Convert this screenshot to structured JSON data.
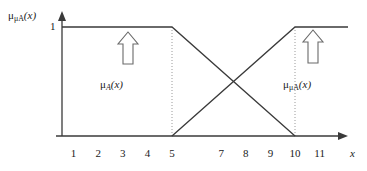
{
  "figure": {
    "background_color": "#ffffff",
    "line_color": "#3a3a3a",
    "text_color": "#1a1a1a",
    "guide_color": "#9a9a9a",
    "y_axis_label_parts": {
      "base": "μ",
      "subscript": "μA",
      "arg": "(x)"
    },
    "y_tick_one": "1",
    "x_axis_label": "x",
    "left_function_label_parts": {
      "base": "μ",
      "subscript": "A",
      "arg": "(x)"
    },
    "right_function_label_parts": {
      "base": "μ",
      "subscript": "μA",
      "arg": "(x)"
    },
    "left_arrow_icon": "up-arrow-outline",
    "right_arrow_icon": "up-arrow-outline",
    "y_axis_arrow_icon": "filled-arrowhead-up",
    "x_axis_arrow_icon": "filled-arrowhead-right"
  },
  "chart_data": {
    "type": "line",
    "title": "",
    "xlabel": "x",
    "ylabel": "μμA(x)",
    "xlim": [
      0,
      12
    ],
    "ylim": [
      0,
      1
    ],
    "grid": false,
    "legend": "none",
    "xticks": [
      {
        "value": 1,
        "label": "1"
      },
      {
        "value": 2,
        "label": "2"
      },
      {
        "value": 3,
        "label": "3"
      },
      {
        "value": 4,
        "label": "4"
      },
      {
        "value": 5,
        "label": "5"
      },
      {
        "value": 6,
        "label": ""
      },
      {
        "value": 7,
        "label": "7"
      },
      {
        "value": 8,
        "label": "8"
      },
      {
        "value": 9,
        "label": "9"
      },
      {
        "value": 10,
        "label": "10"
      },
      {
        "value": 11,
        "label": "11"
      }
    ],
    "yticks": [
      {
        "value": 1,
        "label": "1"
      }
    ],
    "series": [
      {
        "name": "μA(x)",
        "description": "plateau at 1 until x=5 then falls linearly to 0 at x=10",
        "x": [
          0,
          5,
          10
        ],
        "y": [
          1,
          1,
          0
        ]
      },
      {
        "name": "μμA(x)",
        "description": "zero until x=5 then rises linearly to 1 at x=10 and stays at 1",
        "x": [
          5,
          10,
          12
        ],
        "y": [
          0,
          1,
          1
        ]
      }
    ],
    "guides": [
      {
        "type": "vertical-dotted",
        "x": 5,
        "y_from": 0,
        "y_to": 1
      },
      {
        "type": "vertical-dotted",
        "x": 10,
        "y_from": 0,
        "y_to": 1
      }
    ],
    "annotations": [
      {
        "label": "μA(x)",
        "x": 3.0,
        "y": 0.55,
        "marker": "up-arrow-outline"
      },
      {
        "label": "μμA(x)",
        "x": 10.9,
        "y": 0.6,
        "marker": "up-arrow-outline"
      }
    ]
  }
}
